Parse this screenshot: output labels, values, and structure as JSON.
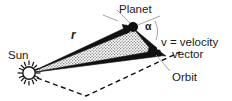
{
  "figure": {
    "type": "diagram",
    "background_color": "#ffffff",
    "line_color": "#111111",
    "fill_color": "#d8d8d8"
  },
  "labels": {
    "planet": "Planet",
    "sun": "Sun",
    "radius": "r",
    "angle": "α",
    "velocity_line1": "v = velocity",
    "velocity_line2": "vector",
    "orbit": "Orbit"
  },
  "geometry": {
    "sun_point": [
      29,
      73
    ],
    "planet_point": [
      133,
      27
    ],
    "velocity_tip": [
      164,
      55
    ],
    "swept_area_vertices": [
      [
        29,
        73
      ],
      [
        133,
        27
      ],
      [
        164,
        55
      ]
    ],
    "radius_vector": {
      "from": [
        29,
        73
      ],
      "to": [
        133,
        27
      ],
      "label": "r"
    },
    "velocity_vector": {
      "from": [
        133,
        27
      ],
      "to": [
        164,
        55
      ],
      "label": "v"
    },
    "angle_alpha": {
      "at": [
        133,
        27
      ],
      "between": [
        "radius-extension",
        "velocity-vector"
      ],
      "label": "α"
    },
    "orbit_path": "dashed curve through sun region and out past velocity tip"
  },
  "icons": {
    "sun": "sun-icon",
    "planet": "planet-dot-icon",
    "arrow": "arrowhead-icon"
  }
}
